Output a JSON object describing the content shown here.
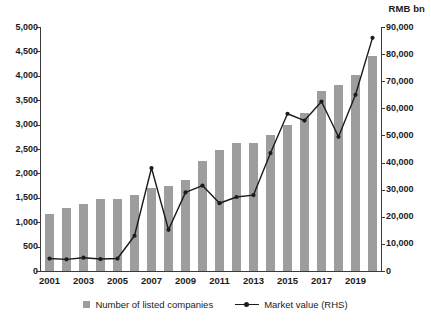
{
  "chart_data": {
    "type": "bar",
    "title": "",
    "subtitle": "",
    "xlabel": "",
    "ylabel": "",
    "y2label": "RMB bn",
    "grid": false,
    "legend_position": "bottom",
    "categories": [
      "2001",
      "2002",
      "2003",
      "2004",
      "2005",
      "2006",
      "2007",
      "2008",
      "2009",
      "2010",
      "2011",
      "2012",
      "2013",
      "2014",
      "2015",
      "2016",
      "2017",
      "2018",
      "2019",
      "2020"
    ],
    "x_tick_labels": [
      "2001",
      "2003",
      "2005",
      "2007",
      "2009",
      "2011",
      "2013",
      "2015",
      "2017",
      "2019"
    ],
    "ylim": [
      0,
      5000
    ],
    "y2lim": [
      0,
      90000
    ],
    "y_tick_labels": [
      "0",
      "500",
      "1,000",
      "1,500",
      "2,000",
      "2,500",
      "3,000",
      "3,500",
      "4,000",
      "4,500",
      "5,000"
    ],
    "y_ticks": [
      0,
      500,
      1000,
      1500,
      2000,
      2500,
      3000,
      3500,
      4000,
      4500,
      5000
    ],
    "y2_tick_labels": [
      "0",
      "10,000",
      "20,000",
      "30,000",
      "40,000",
      "50,000",
      "60,000",
      "70,000",
      "80,000",
      "90,000"
    ],
    "y2_ticks": [
      0,
      10000,
      20000,
      30000,
      40000,
      50000,
      60000,
      70000,
      80000,
      90000
    ],
    "series": [
      {
        "name": "Number of listed companies",
        "type": "bar",
        "axis": "left",
        "color": "#9d9d9d",
        "values": [
          1160,
          1285,
          1370,
          1470,
          1480,
          1550,
          1700,
          1735,
          1855,
          2245,
          2480,
          2620,
          2620,
          2780,
          3000,
          3240,
          3680,
          3810,
          4020,
          4400
        ]
      },
      {
        "name": "Market value (RHS)",
        "type": "line",
        "axis": "right",
        "color": "#1b1b1b",
        "values": [
          4600,
          4300,
          4900,
          4400,
          4600,
          13000,
          38000,
          15200,
          29000,
          31500,
          25000,
          27300,
          28000,
          43500,
          58000,
          55500,
          62500,
          49500,
          65000,
          86000
        ]
      }
    ],
    "legend": [
      {
        "label": "Number of listed companies",
        "marker": "bar-swatch"
      },
      {
        "label": "Market value (RHS)",
        "marker": "line-marker"
      }
    ],
    "colors": {
      "bar": "#9d9d9d",
      "line": "#1b1b1b",
      "axis": "#3a3a3a",
      "background": "#ffffff"
    }
  }
}
